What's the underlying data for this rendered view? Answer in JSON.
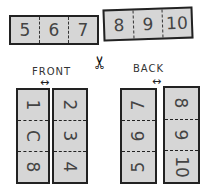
{
  "top_strips": {
    "left": [
      "5",
      "6",
      "7"
    ],
    "right": [
      "8",
      "9",
      "10"
    ]
  },
  "scissors_icon": "✂",
  "front": {
    "label": "FRONT",
    "arrow": "↔",
    "left_column": [
      "1",
      "C",
      "8"
    ],
    "right_column": [
      "2",
      "3",
      "4"
    ]
  },
  "back": {
    "label": "BACK",
    "arrow": "↔",
    "left_column": [
      "7",
      "6",
      "5"
    ],
    "right_column": [
      "8",
      "9",
      "10"
    ]
  }
}
